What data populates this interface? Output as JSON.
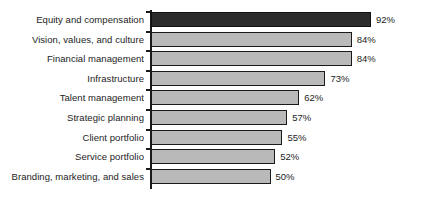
{
  "chart_data": {
    "type": "bar",
    "orientation": "horizontal",
    "title": "",
    "subtitle": "",
    "xlabel": "",
    "ylabel": "",
    "xlim": [
      0,
      100
    ],
    "grid": false,
    "legend": null,
    "value_suffix": "%",
    "categories": [
      "Equity and compensation",
      "Vision, values, and culture",
      "Financial management",
      "Infrastructure",
      "Talent management",
      "Strategic planning",
      "Client portfolio",
      "Service portfolio",
      "Branding, marketing, and sales"
    ],
    "values": [
      92,
      84,
      84,
      73,
      62,
      57,
      55,
      52,
      50
    ],
    "data_labels": [
      "92%",
      "84%",
      "84%",
      "73%",
      "62%",
      "57%",
      "55%",
      "52%",
      "50%"
    ],
    "colors": {
      "bar_fill": "#b9b9b9",
      "bar_highlight_fill": "#2c2c2c",
      "bar_border": "#1a1a1a",
      "axis": "#1a1a1a",
      "text": "#1c1c1c",
      "background": "#ffffff"
    },
    "highlight_index": 0,
    "bars": [
      {
        "category": "Equity and compensation",
        "value": 92,
        "label": "92%",
        "highlight": true
      },
      {
        "category": "Vision, values, and culture",
        "value": 84,
        "label": "84%",
        "highlight": false
      },
      {
        "category": "Financial management",
        "value": 84,
        "label": "84%",
        "highlight": false
      },
      {
        "category": "Infrastructure",
        "value": 73,
        "label": "73%",
        "highlight": false
      },
      {
        "category": "Talent management",
        "value": 62,
        "label": "62%",
        "highlight": false
      },
      {
        "category": "Strategic planning",
        "value": 57,
        "label": "57%",
        "highlight": false
      },
      {
        "category": "Client portfolio",
        "value": 55,
        "label": "55%",
        "highlight": false
      },
      {
        "category": "Service portfolio",
        "value": 52,
        "label": "52%",
        "highlight": false
      },
      {
        "category": "Branding, marketing, and sales",
        "value": 50,
        "label": "50%",
        "highlight": false
      }
    ]
  },
  "layout": {
    "axis_x": 151,
    "plot_top": 10,
    "row_height": 19.6,
    "bar_height": 15,
    "px_per_unit": 2.39,
    "label_gap": 5
  }
}
